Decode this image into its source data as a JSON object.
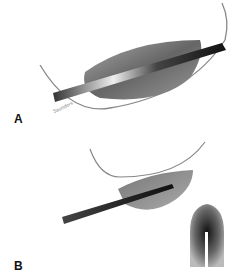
{
  "figure": {
    "panels": [
      {
        "id": "A",
        "label": "A",
        "description": "Instrument inserted through a lens-shaped gray structure with a curved arc",
        "signature": "Saunders"
      },
      {
        "id": "B",
        "label": "B",
        "description": "Instrument inserted partially into a gray half-dome structure with a curved arc, plus inset cross-section view",
        "inset_label": "inset cross-section"
      }
    ],
    "colors": {
      "background": "#ffffff",
      "structure_dark": "#555555",
      "structure_light": "#bbbbbb",
      "instrument": "#222222",
      "arc": "#888888"
    }
  }
}
